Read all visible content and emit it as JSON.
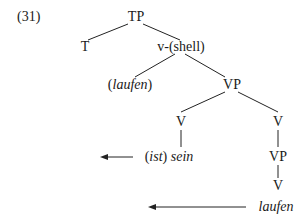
{
  "example_number": "(31)",
  "nodes": {
    "tp": "TP",
    "t": "T",
    "vshell": "v-(shell)",
    "laufen_paren_open": "(",
    "laufen_paren_word": "laufen",
    "laufen_paren_close": ")",
    "vp_upper": "VP",
    "v_left": "V",
    "v_right": "V",
    "ist_open": "(",
    "ist_word": "ist",
    "ist_close": ")",
    "sein": "sein",
    "vp_lower": "VP",
    "v_lower": "V",
    "laufen_leaf": "laufen"
  },
  "arrows": [
    {
      "from_x": 133,
      "to_x": 100,
      "y": 157
    },
    {
      "from_x": 246,
      "to_x": 148,
      "y": 207
    }
  ]
}
